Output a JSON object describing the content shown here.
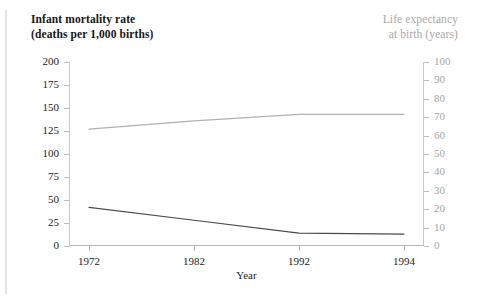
{
  "titles": {
    "left": "Infant mortality rate\n(deaths per 1,000 births)",
    "right": "Life expectancy\nat birth (years)"
  },
  "colors": {
    "infant_mortality_line": "#4a4a4a",
    "life_expectancy_line": "#b0b0b0",
    "left_axis_text": "#242424",
    "right_axis_text": "#a6a6a6",
    "axis_line": "#bdbdbd"
  },
  "chart_data": {
    "type": "line",
    "title": "",
    "xlabel": "Year",
    "categories": [
      "1972",
      "1982",
      "1992",
      "1994"
    ],
    "grid": false,
    "legend": "none",
    "axes": {
      "left": {
        "label": "Infant mortality rate (deaths per 1,000 births)",
        "ylim": [
          0,
          200
        ],
        "ticks": [
          200,
          175,
          150,
          125,
          100,
          75,
          50,
          25,
          0
        ]
      },
      "right": {
        "label": "Life expectancy at birth (years)",
        "ylim": [
          0,
          100
        ],
        "ticks": [
          100,
          90,
          80,
          70,
          60,
          50,
          40,
          30,
          20,
          10,
          0
        ]
      }
    },
    "series": [
      {
        "name": "Infant mortality rate",
        "axis": "left",
        "color": "#4a4a4a",
        "values": [
          42,
          28,
          14,
          13
        ]
      },
      {
        "name": "Life expectancy at birth",
        "axis": "right",
        "color": "#b0b0b0",
        "values": [
          63.5,
          68,
          71.5,
          71.5
        ]
      }
    ]
  }
}
